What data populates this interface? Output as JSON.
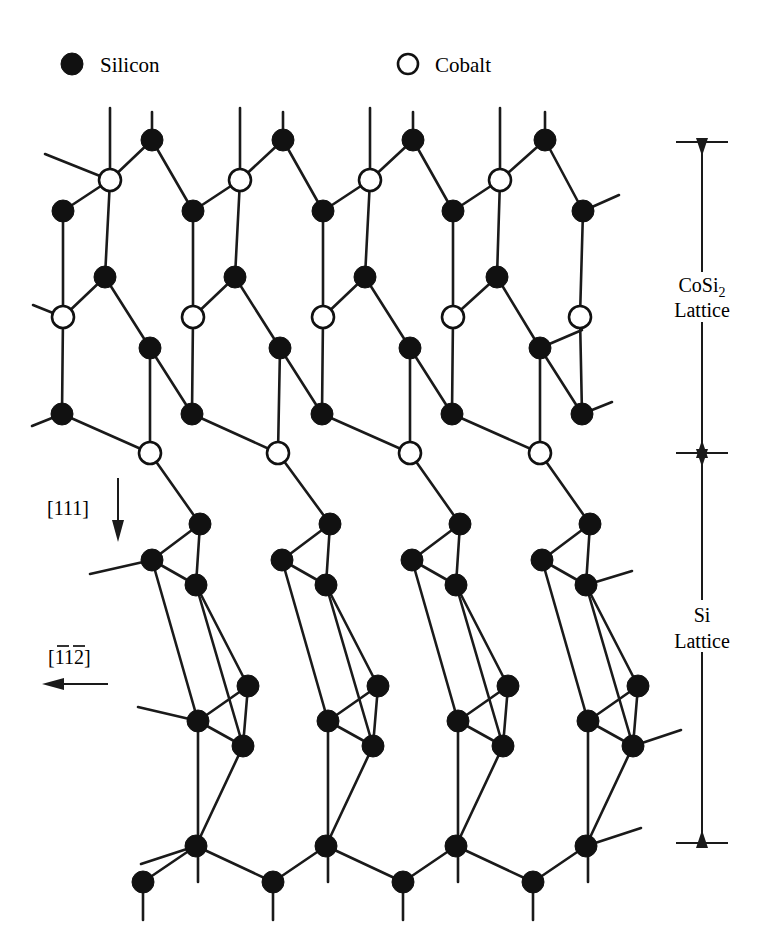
{
  "figure": {
    "background_color": "#ffffff",
    "line_color": "#1a1a1a",
    "atom_fill_silicon": "#111111",
    "atom_fill_cobalt": "#ffffff"
  },
  "legend": {
    "items": [
      {
        "symbol": "filled-circle",
        "label": "Silicon",
        "x": 72,
        "y": 64,
        "label_x": 100
      },
      {
        "symbol": "open-circle",
        "label": "Cobalt",
        "x": 408,
        "y": 64,
        "label_x": 435
      }
    ]
  },
  "annotations": {
    "region_upper": {
      "line1": "CoSi",
      "subscript": "2",
      "line2": "Lattice",
      "x": 702,
      "y1": 288,
      "y2": 312,
      "bracket_top": 142,
      "bracket_bottom": 453
    },
    "region_lower": {
      "line1": "Si",
      "line2": "Lattice",
      "x": 702,
      "y1": 618,
      "y2": 646,
      "bracket_top": 453,
      "bracket_bottom": 843
    },
    "direction_vertical": {
      "label": "[111]",
      "label_x": 47,
      "label_y": 508,
      "arrow_x": 118,
      "arrow_y_start": 478,
      "arrow_y_end": 540,
      "arrow_direction": "down"
    },
    "direction_horizontal": {
      "label_prefix": "[",
      "digit1": "1",
      "digit2": "1",
      "digit3": "2",
      "label_suffix": "]",
      "label_full": "[1̄1̄2]",
      "label_x": 48,
      "label_y": 660,
      "arrow_y": 684,
      "arrow_x_start": 108,
      "arrow_x_end": 45,
      "arrow_direction": "left",
      "overbars": [
        {
          "x": 57,
          "width": 12,
          "y": 645
        },
        {
          "x": 73,
          "width": 12,
          "y": 645
        }
      ]
    }
  },
  "lattice": {
    "atom_radius_si": 11,
    "atom_radius_co": 11,
    "column_pitch": 130,
    "row_shift": 47,
    "cosi2": {
      "rows": [
        {
          "name": "si-top-row",
          "type": "Si",
          "y": 140,
          "x": [
            152,
            283,
            413,
            545
          ]
        },
        {
          "name": "co-row-1",
          "type": "Co",
          "y": 180,
          "x": [
            110,
            240,
            370,
            500
          ]
        },
        {
          "name": "si-row-2",
          "type": "Si",
          "y": 211,
          "x": [
            63,
            193,
            323,
            453,
            583
          ]
        },
        {
          "name": "si-row-3",
          "type": "Si",
          "y": 277,
          "x": [
            105,
            235,
            365,
            497
          ]
        },
        {
          "name": "co-row-2",
          "type": "Co",
          "y": 317,
          "x": [
            63,
            193,
            323,
            453,
            580
          ]
        },
        {
          "name": "si-row-4",
          "type": "Si",
          "y": 348,
          "x": [
            150,
            280,
            410,
            540
          ]
        },
        {
          "name": "si-row-5",
          "type": "Si",
          "y": 414,
          "x": [
            62,
            192,
            322,
            452,
            582
          ]
        },
        {
          "name": "co-row-3",
          "type": "Co",
          "y": 453,
          "x": [
            150,
            278,
            410,
            540
          ]
        }
      ]
    },
    "si": {
      "rows": [
        {
          "name": "si-row-6",
          "type": "Si",
          "y": 524,
          "x": [
            200,
            330,
            460,
            590
          ]
        },
        {
          "name": "si-row-7",
          "type": "Si",
          "y": 560,
          "x": [
            152,
            282,
            412,
            542
          ]
        },
        {
          "name": "si-row-8",
          "type": "Si",
          "y": 585,
          "x": [
            196,
            326,
            456,
            586
          ]
        },
        {
          "name": "si-row-9",
          "type": "Si",
          "y": 686,
          "x": [
            248,
            378,
            508,
            638
          ]
        },
        {
          "name": "si-row-10",
          "type": "Si",
          "y": 721,
          "x": [
            198,
            328,
            458,
            588
          ]
        },
        {
          "name": "si-row-11",
          "type": "Si",
          "y": 746,
          "x": [
            243,
            373,
            503,
            633
          ]
        },
        {
          "name": "si-row-12",
          "type": "Si",
          "y": 846,
          "x": [
            196,
            326,
            456,
            586
          ]
        },
        {
          "name": "si-row-13",
          "type": "Si",
          "y": 882,
          "x": [
            143,
            273,
            403,
            533
          ]
        }
      ]
    }
  }
}
